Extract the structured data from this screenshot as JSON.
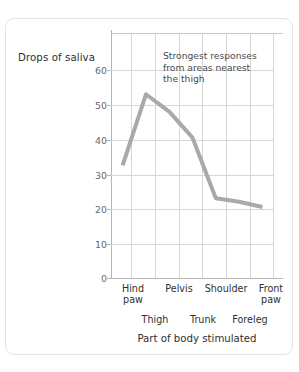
{
  "chart_data": {
    "type": "line",
    "title": "",
    "xlabel": "Part of body stimulated",
    "ylabel": "Drops of saliva",
    "ylim": [
      0,
      70
    ],
    "yticks": [
      0,
      10,
      20,
      30,
      40,
      50,
      60
    ],
    "ytick_labels": [
      "0",
      "10",
      "20",
      "30",
      "40",
      "50",
      "60"
    ],
    "grid": true,
    "legend": "none",
    "categories": [
      "Hind paw",
      "Thigh",
      "Pelvis",
      "Trunk",
      "Shoulder",
      "Foreleg",
      "Front paw"
    ],
    "values": [
      32.5,
      53,
      48,
      40.5,
      23,
      22,
      20.5
    ],
    "line_color": "#a9a9a9",
    "grid_color": "#d6d6d6",
    "axis_color": "#b4b4b4",
    "annotations": [
      {
        "name": "strongest-response-note",
        "lines": [
          "Strongest responses",
          "from areas nearest",
          "the thigh"
        ]
      }
    ],
    "x_labels_upper": [
      "Hind\npaw",
      "Pelvis",
      "Shoulder",
      "Front\npaw"
    ],
    "x_labels_lower": [
      "Thigh",
      "Trunk",
      "Foreleg"
    ]
  },
  "axes": {
    "y_title": "Drops of saliva",
    "x_title": "Part of body stimulated",
    "y_ticks": [
      {
        "value": "60"
      },
      {
        "value": "50"
      },
      {
        "value": "40"
      },
      {
        "value": "30"
      },
      {
        "value": "20"
      },
      {
        "value": "10"
      },
      {
        "value": "0"
      }
    ]
  },
  "annotation": {
    "line1": "Strongest responses",
    "line2": "from areas nearest",
    "line3": "the thigh"
  },
  "x_labels": {
    "upper": [
      {
        "line1": "Hind",
        "line2": "paw"
      },
      {
        "line1": "Pelvis",
        "line2": ""
      },
      {
        "line1": "Shoulder",
        "line2": ""
      },
      {
        "line1": "Front",
        "line2": "paw"
      }
    ],
    "lower": [
      {
        "label": "Thigh"
      },
      {
        "label": "Trunk"
      },
      {
        "label": "Foreleg"
      }
    ]
  }
}
